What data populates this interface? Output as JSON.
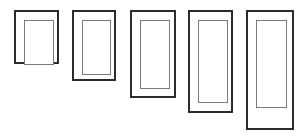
{
  "canvas": {
    "width": 303,
    "height": 136,
    "background": "#ffffff",
    "title": "Series of five nested rectangle outlines of increasing height"
  },
  "style": {
    "outer_stroke_color": "#2b2b2b",
    "outer_stroke_width": 2,
    "inner_stroke_color": "#7a7a7a",
    "inner_stroke_width": 1,
    "fill_color": "#ffffff"
  },
  "shapes": [
    {
      "id": 1,
      "name": "rectangle-pair-1",
      "outer": {
        "x": 14,
        "y": 10,
        "width": 45,
        "height": 54
      },
      "inner": {
        "x": 8,
        "y": 8,
        "width": 30,
        "height": 45
      }
    },
    {
      "id": 2,
      "name": "rectangle-pair-2",
      "outer": {
        "x": 72,
        "y": 10,
        "width": 44,
        "height": 71
      },
      "inner": {
        "x": 8,
        "y": 8,
        "width": 29,
        "height": 55
      }
    },
    {
      "id": 3,
      "name": "rectangle-pair-3",
      "outer": {
        "x": 130,
        "y": 10,
        "width": 46,
        "height": 88
      },
      "inner": {
        "x": 8,
        "y": 8,
        "width": 30,
        "height": 69
      }
    },
    {
      "id": 4,
      "name": "rectangle-pair-4",
      "outer": {
        "x": 188,
        "y": 10,
        "width": 45,
        "height": 103
      },
      "inner": {
        "x": 8,
        "y": 8,
        "width": 30,
        "height": 83
      }
    },
    {
      "id": 5,
      "name": "rectangle-pair-5",
      "outer": {
        "x": 246,
        "y": 10,
        "width": 48,
        "height": 120
      },
      "inner": {
        "x": 8,
        "y": 8,
        "width": 31,
        "height": 88
      }
    }
  ]
}
